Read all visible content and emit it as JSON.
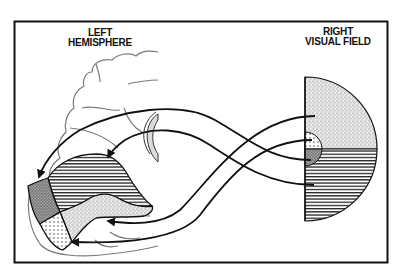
{
  "figure": {
    "title_left": {
      "line1": "LEFT",
      "line2": "HEMISPHERE"
    },
    "title_right": {
      "line1": "RIGHT",
      "line2": "VISUAL FIELD"
    }
  },
  "regions": {
    "visual_field": [
      {
        "name": "upper-peripheral",
        "pattern": "fine-stipple"
      },
      {
        "name": "upper-central",
        "pattern": "coarse-dots"
      },
      {
        "name": "lower-central",
        "pattern": "dark-stipple"
      },
      {
        "name": "lower-peripheral",
        "pattern": "horizontal-stripes"
      }
    ],
    "cortex": [
      {
        "name": "striped-region",
        "pattern": "horizontal-stripes"
      },
      {
        "name": "light-stipple-region",
        "pattern": "fine-stipple"
      },
      {
        "name": "dark-stipple-region",
        "pattern": "dark-stipple"
      },
      {
        "name": "dotted-region",
        "pattern": "coarse-dots"
      }
    ]
  },
  "pathways": [
    {
      "from": "upper-peripheral",
      "to": "lower-bank"
    },
    {
      "from": "upper-central",
      "to": "occipital-pole-upper"
    },
    {
      "from": "lower-central",
      "to": "occipital-pole-lower"
    },
    {
      "from": "lower-peripheral",
      "to": "upper-bank"
    }
  ],
  "colors": {
    "ink": "#111111",
    "brain_outline": "#777777",
    "paper": "#ffffff"
  }
}
